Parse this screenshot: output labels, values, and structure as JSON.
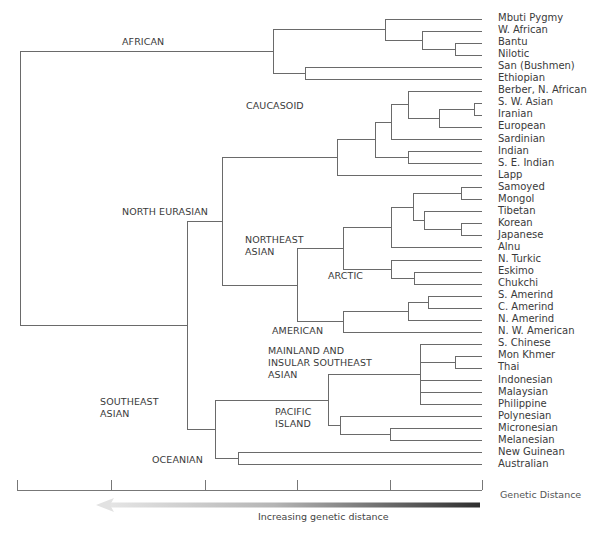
{
  "figure": {
    "type": "phylogenetic-tree",
    "leaf_x_end": 482,
    "row_start_y": 19,
    "row_spacing": 12.05,
    "line_color": "#6a6a6a",
    "leaves": [
      "Mbuti Pygmy",
      "W. African",
      "Bantu",
      "Nilotic",
      "San (Bushmen)",
      "Ethiopian",
      "Berber, N. African",
      "S. W. Asian",
      "Iranian",
      "European",
      "Sardinian",
      "Indian",
      "S. E. Indian",
      "Lapp",
      "Samoyed",
      "Mongol",
      "Tibetan",
      "Korean",
      "Japanese",
      "Alnu",
      "N. Turkic",
      "Eskimo",
      "Chukchi",
      "S. Amerind",
      "C. Amerind",
      "N. Amerind",
      "N. W. American",
      "S. Chinese",
      "Mon Khmer",
      "Thai",
      "Indonesian",
      "Malaysian",
      "Philippine",
      "Polynesian",
      "Micronesian",
      "Melanesian",
      "New Guinean",
      "Australian"
    ],
    "clade_labels": [
      {
        "text": "AFRICAN",
        "x": 122,
        "y": 36
      },
      {
        "text": "CAUCASOID",
        "x": 246,
        "y": 100
      },
      {
        "text": "NORTH EURASIAN",
        "x": 122,
        "y": 206
      },
      {
        "text": "NORTHEAST\nASIAN",
        "x": 245,
        "y": 234
      },
      {
        "text": "ARCTIC",
        "x": 328,
        "y": 270
      },
      {
        "text": "AMERICAN",
        "x": 272,
        "y": 325
      },
      {
        "text": "MAINLAND AND\nINSULAR SOUTHEAST\nASIAN",
        "x": 268,
        "y": 345
      },
      {
        "text": "PACIFIC\nISLAND",
        "x": 275,
        "y": 406
      },
      {
        "text": "SOUTHEAST\nASIAN",
        "x": 100,
        "y": 396
      },
      {
        "text": "OCEANIAN",
        "x": 152,
        "y": 454
      }
    ],
    "tree": {
      "x": 20,
      "children": [
        {
          "x": 273,
          "children": [
            {
              "x": 385,
              "children": [
                {
                  "leaf": 0
                },
                {
                  "x": 422,
                  "children": [
                    {
                      "leaf": 1
                    },
                    {
                      "x": 455,
                      "children": [
                        {
                          "leaf": 2
                        },
                        {
                          "leaf": 3
                        }
                      ]
                    }
                  ]
                }
              ]
            },
            {
              "x": 305,
              "children": [
                {
                  "leaf": 4
                },
                {
                  "leaf": 5
                }
              ]
            }
          ]
        },
        {
          "x": 187,
          "children": [
            {
              "x": 222,
              "children": [
                {
                  "x": 337,
                  "children": [
                    {
                      "x": 375,
                      "children": [
                        {
                          "x": 391,
                          "children": [
                            {
                              "x": 408,
                              "children": [
                                {
                                  "leaf": 6
                                },
                                {
                                  "x": 439,
                                  "children": [
                                    {
                                      "x": 474,
                                      "children": [
                                        {
                                          "leaf": 7
                                        },
                                        {
                                          "leaf": 8
                                        }
                                      ]
                                    },
                                    {
                                      "leaf": 9
                                    }
                                  ]
                                }
                              ]
                            },
                            {
                              "leaf": 10
                            }
                          ]
                        },
                        {
                          "x": 408,
                          "children": [
                            {
                              "leaf": 11
                            },
                            {
                              "leaf": 12
                            }
                          ]
                        }
                      ]
                    },
                    {
                      "leaf": 13
                    }
                  ]
                },
                {
                  "x": 297,
                  "children": [
                    {
                      "x": 343,
                      "children": [
                        {
                          "x": 391,
                          "children": [
                            {
                              "x": 413,
                              "children": [
                                {
                                  "x": 461,
                                  "children": [
                                    {
                                      "leaf": 14
                                    },
                                    {
                                      "leaf": 15
                                    }
                                  ]
                                },
                                {
                                  "x": 424,
                                  "children": [
                                    {
                                      "leaf": 16
                                    },
                                    {
                                      "x": 461,
                                      "children": [
                                        {
                                          "leaf": 17
                                        },
                                        {
                                          "leaf": 18
                                        }
                                      ]
                                    }
                                  ]
                                }
                              ]
                            },
                            {
                              "leaf": 19
                            }
                          ]
                        },
                        {
                          "x": 391,
                          "children": [
                            {
                              "leaf": 20
                            },
                            {
                              "x": 414,
                              "children": [
                                {
                                  "leaf": 21
                                },
                                {
                                  "leaf": 22
                                }
                              ]
                            }
                          ]
                        }
                      ]
                    },
                    {
                      "x": 343,
                      "children": [
                        {
                          "x": 408,
                          "children": [
                            {
                              "x": 428,
                              "children": [
                                {
                                  "leaf": 23
                                },
                                {
                                  "leaf": 24
                                }
                              ]
                            },
                            {
                              "leaf": 25
                            }
                          ]
                        },
                        {
                          "leaf": 26
                        }
                      ]
                    }
                  ]
                }
              ]
            },
            {
              "x": 215,
              "children": [
                {
                  "x": 328,
                  "children": [
                    {
                      "x": 420,
                      "children": [
                        {
                          "leaf": 27
                        },
                        {
                          "x": 455,
                          "children": [
                            {
                              "leaf": 28
                            },
                            {
                              "leaf": 29
                            }
                          ]
                        },
                        {
                          "leaf": 30
                        },
                        {
                          "leaf": 31
                        },
                        {
                          "leaf": 32
                        }
                      ]
                    },
                    {
                      "x": 340,
                      "children": [
                        {
                          "leaf": 33
                        },
                        {
                          "x": 390,
                          "children": [
                            {
                              "leaf": 34
                            },
                            {
                              "leaf": 35
                            }
                          ]
                        }
                      ]
                    }
                  ]
                },
                {
                  "x": 238,
                  "children": [
                    {
                      "leaf": 36
                    },
                    {
                      "leaf": 37
                    }
                  ]
                }
              ]
            }
          ]
        }
      ]
    },
    "scale_bar": {
      "y": 490,
      "tick_top": 480,
      "ticks_x": [
        17,
        111,
        205,
        297,
        390,
        482
      ],
      "title": "Genetic Distance"
    },
    "arrow": {
      "x_start": 480,
      "x_end": 96,
      "y": 505,
      "caption": "Increasing genetic distance",
      "color_dark": "#333333",
      "color_light": "#e0e0e0"
    }
  }
}
